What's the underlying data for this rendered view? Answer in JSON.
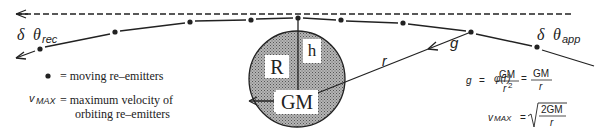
{
  "diagram": {
    "type": "physics-schematic",
    "labels": {
      "theta_rec_delta": "δ",
      "theta_rec_symbol": "θ",
      "theta_rec_sub": "rec",
      "theta_app_delta": "δ",
      "theta_app_symbol": "θ",
      "theta_app_sub": "app",
      "g": "g",
      "r": "r",
      "R": "R",
      "h": "h",
      "GM": "GM"
    },
    "legend": {
      "dot_text": "= moving re–emitters",
      "vmax_symbol": "v",
      "vmax_sub": "MAX",
      "vmax_line1": "= maximum velocity of",
      "vmax_line2": "orbiting re–emitters"
    },
    "equations": {
      "g_lhs": "g",
      "g_eq": "=",
      "g_num": "GM",
      "g_den": "r",
      "g_den_exp": "2",
      "phi_lhs": "φ(r)",
      "phi_eq": "=",
      "phi_num": "GM",
      "phi_den": "r",
      "vmax_lhs": "v",
      "vmax_lhs_sub": "MAX",
      "vmax_eq": "=",
      "vmax_num": "2GM",
      "vmax_den": "r"
    },
    "colors": {
      "ink": "#222222",
      "mass_fill": "#9a9a9a",
      "label_box": "#ffffff"
    },
    "emitter_dots": [
      {
        "x": 40,
        "y": 49
      },
      {
        "x": 115,
        "y": 32
      },
      {
        "x": 190,
        "y": 22
      },
      {
        "x": 251,
        "y": 20
      },
      {
        "x": 298,
        "y": 18
      },
      {
        "x": 341,
        "y": 20
      },
      {
        "x": 403,
        "y": 23
      },
      {
        "x": 471,
        "y": 32
      },
      {
        "x": 537,
        "y": 47
      }
    ]
  }
}
